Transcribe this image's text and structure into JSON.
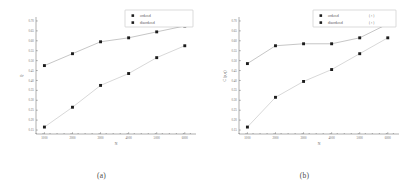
{
  "figure": {
    "panels": [
      {
        "caption": "(a)",
        "legend": {
          "entries": [
            {
              "label": "ordered",
              "suffix": "",
              "marker": "square",
              "color": "#1c1c1c"
            },
            {
              "label": "disordered",
              "suffix": "",
              "marker": "square",
              "color": "#1c1c1c"
            }
          ]
        },
        "chart_data": {
          "type": "line",
          "title": "",
          "xlabel": "N",
          "ylabel": "Q",
          "x": [
            1000,
            2000,
            3000,
            4000,
            5000,
            6000
          ],
          "xlim": [
            700,
            6400
          ],
          "ylim": [
            0.13,
            0.72
          ],
          "xticks": [
            "1000",
            "2000",
            "3000",
            "4000",
            "5000",
            "6000"
          ],
          "yticks": [
            "0.15",
            "0.20",
            "0.25",
            "0.30",
            "0.35",
            "0.40",
            "0.45",
            "0.50",
            "0.55",
            "0.60",
            "0.65",
            "0.70"
          ],
          "grid": false,
          "legend_position": "top-right",
          "series": [
            {
              "name": "ordered",
              "values": [
                0.475,
                0.535,
                0.595,
                0.615,
                0.645,
                0.675
              ]
            },
            {
              "name": "disordered",
              "values": [
                0.165,
                0.265,
                0.375,
                0.435,
                0.515,
                0.575
              ]
            }
          ]
        }
      },
      {
        "caption": "(b)",
        "legend": {
          "entries": [
            {
              "label": "ordered",
              "suffix": "( × )",
              "marker": "square",
              "color": "#1c1c1c"
            },
            {
              "label": "disordered",
              "suffix": "( × )",
              "marker": "square",
              "color": "#1c1c1c"
            }
          ]
        },
        "chart_data": {
          "type": "line",
          "title": "",
          "xlabel": "N",
          "ylabel": "C (p, q)",
          "x": [
            1000,
            2000,
            3000,
            4000,
            5000,
            6000
          ],
          "xlim": [
            700,
            6400
          ],
          "ylim": [
            0.13,
            0.72
          ],
          "xticks": [
            "1000",
            "2000",
            "3000",
            "4000",
            "5000",
            "6000"
          ],
          "yticks": [
            "0.15",
            "0.20",
            "0.25",
            "0.30",
            "0.35",
            "0.40",
            "0.45",
            "0.50",
            "0.55",
            "0.60",
            "0.65",
            "0.70"
          ],
          "grid": false,
          "legend_position": "top-right",
          "series": [
            {
              "name": "ordered",
              "values": [
                0.485,
                0.575,
                0.585,
                0.585,
                0.615,
                0.685
              ]
            },
            {
              "name": "disordered",
              "values": [
                0.165,
                0.315,
                0.395,
                0.455,
                0.535,
                0.615
              ]
            }
          ]
        }
      }
    ]
  },
  "colors": {
    "background": "#ffffff",
    "axis": "#4d4d4d",
    "marker": "#1c1c1c",
    "line_ordered": "#8c8c8c",
    "line_disordered": "#b0b0b0"
  }
}
